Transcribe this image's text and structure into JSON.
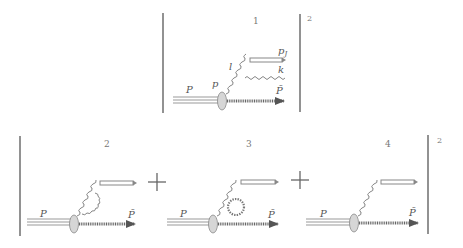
{
  "figure": {
    "type": "squared amplitude of Feynman diagrams",
    "exponent": "2",
    "top_row": {
      "diagram_number": "1",
      "exponent": "2",
      "labels": {
        "proton": "P",
        "parton": "p",
        "gluon_exchange": "l",
        "jet": "p",
        "jet_sub": "J",
        "emitted_gluon": "k",
        "remnant": "P̃"
      }
    },
    "bottom_row": {
      "exponent": "2",
      "operator": "+",
      "diagrams": [
        {
          "number": "2",
          "proton": "P",
          "remnant": "P̃",
          "feature": "gluon exchange between gluon and remnant"
        },
        {
          "number": "3",
          "proton": "P",
          "remnant": "P̃",
          "feature": "gluon self-energy loop"
        },
        {
          "number": "4",
          "proton": "P",
          "remnant": "P̃",
          "feature": "tree-level"
        }
      ]
    },
    "colors": {
      "lines": "#888888",
      "bars": "#777777",
      "blob": "#d6d6d6",
      "remnant": "#666666",
      "text": "#555555"
    }
  }
}
